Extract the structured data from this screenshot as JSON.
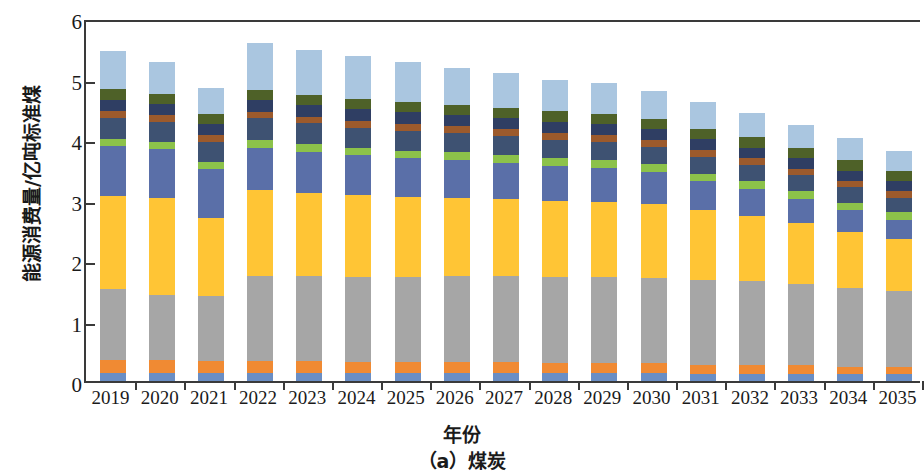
{
  "chart_data": {
    "type": "bar",
    "stacked": true,
    "title": "",
    "caption": "（a）煤炭",
    "xlabel": "年份",
    "ylabel": "能源消费量/亿吨标准煤",
    "ylim": [
      0,
      6
    ],
    "yticks": [
      0,
      1,
      2,
      3,
      4,
      5,
      6
    ],
    "ytick_labels": [
      "0",
      "1",
      "2",
      "3",
      "4",
      "5",
      "6"
    ],
    "grid": false,
    "legend": "none",
    "categories": [
      "2019",
      "2020",
      "2021",
      "2022",
      "2023",
      "2024",
      "2025",
      "2026",
      "2027",
      "2028",
      "2029",
      "2030",
      "2031",
      "2032",
      "2033",
      "2034",
      "2035"
    ],
    "series": [
      {
        "name": "s1",
        "color": "#6a8ec4",
        "values": [
          0.13,
          0.13,
          0.13,
          0.13,
          0.13,
          0.13,
          0.13,
          0.13,
          0.13,
          0.13,
          0.13,
          0.13,
          0.12,
          0.12,
          0.12,
          0.11,
          0.11
        ]
      },
      {
        "name": "s2",
        "color": "#f08a33",
        "values": [
          0.22,
          0.21,
          0.2,
          0.2,
          0.2,
          0.19,
          0.19,
          0.18,
          0.18,
          0.17,
          0.17,
          0.16,
          0.15,
          0.15,
          0.14,
          0.13,
          0.13
        ]
      },
      {
        "name": "s3",
        "color": "#a6a6a6",
        "values": [
          1.17,
          1.08,
          1.08,
          1.4,
          1.4,
          1.4,
          1.4,
          1.42,
          1.42,
          1.42,
          1.42,
          1.42,
          1.4,
          1.38,
          1.35,
          1.3,
          1.25
        ]
      },
      {
        "name": "s4",
        "color": "#ffc535",
        "values": [
          1.54,
          1.6,
          1.28,
          1.42,
          1.38,
          1.35,
          1.32,
          1.3,
          1.28,
          1.26,
          1.24,
          1.22,
          1.15,
          1.08,
          1.0,
          0.92,
          0.85
        ]
      },
      {
        "name": "s5",
        "color": "#5a6fa8",
        "values": [
          0.83,
          0.82,
          0.82,
          0.7,
          0.68,
          0.66,
          0.64,
          0.62,
          0.6,
          0.58,
          0.56,
          0.52,
          0.48,
          0.44,
          0.4,
          0.36,
          0.32
        ]
      },
      {
        "name": "s6",
        "color": "#8cc24a",
        "values": [
          0.11,
          0.11,
          0.11,
          0.13,
          0.13,
          0.13,
          0.13,
          0.13,
          0.13,
          0.13,
          0.13,
          0.13,
          0.13,
          0.13,
          0.13,
          0.13,
          0.13
        ]
      },
      {
        "name": "s7",
        "color": "#3e5272",
        "values": [
          0.35,
          0.33,
          0.33,
          0.36,
          0.34,
          0.33,
          0.33,
          0.32,
          0.31,
          0.3,
          0.3,
          0.29,
          0.28,
          0.27,
          0.26,
          0.25,
          0.24
        ]
      },
      {
        "name": "s8",
        "color": "#9c5a2c",
        "values": [
          0.11,
          0.11,
          0.11,
          0.11,
          0.11,
          0.11,
          0.11,
          0.11,
          0.11,
          0.11,
          0.11,
          0.11,
          0.11,
          0.11,
          0.11,
          0.11,
          0.11
        ]
      },
      {
        "name": "s9",
        "color": "#2f3e63",
        "values": [
          0.19,
          0.19,
          0.19,
          0.19,
          0.19,
          0.19,
          0.19,
          0.19,
          0.19,
          0.19,
          0.19,
          0.19,
          0.18,
          0.18,
          0.17,
          0.17,
          0.16
        ]
      },
      {
        "name": "s10",
        "color": "#4e6128",
        "values": [
          0.17,
          0.17,
          0.17,
          0.17,
          0.17,
          0.17,
          0.17,
          0.17,
          0.17,
          0.17,
          0.17,
          0.17,
          0.17,
          0.17,
          0.17,
          0.17,
          0.17
        ]
      },
      {
        "name": "s11",
        "color": "#aac6e0",
        "values": [
          0.63,
          0.52,
          0.42,
          0.78,
          0.74,
          0.71,
          0.67,
          0.61,
          0.57,
          0.52,
          0.5,
          0.46,
          0.44,
          0.4,
          0.38,
          0.36,
          0.34
        ]
      }
    ],
    "totals": [
      5.45,
      5.27,
      4.84,
      5.59,
      5.47,
      5.37,
      5.28,
      5.18,
      5.09,
      4.98,
      4.92,
      4.8,
      4.61,
      4.43,
      4.23,
      4.01,
      3.81
    ]
  },
  "axis": {
    "y_title": "能源消费量/亿吨标准煤",
    "x_title": "年份",
    "figure_caption": "（a）煤炭",
    "y_tick_labels": [
      "0",
      "1",
      "2",
      "3",
      "4",
      "5",
      "6"
    ],
    "x_tick_labels": [
      "2019",
      "2020",
      "2021",
      "2022",
      "2023",
      "2024",
      "2025",
      "2026",
      "2027",
      "2028",
      "2029",
      "2030",
      "2031",
      "2032",
      "2033",
      "2034",
      "2035"
    ]
  }
}
